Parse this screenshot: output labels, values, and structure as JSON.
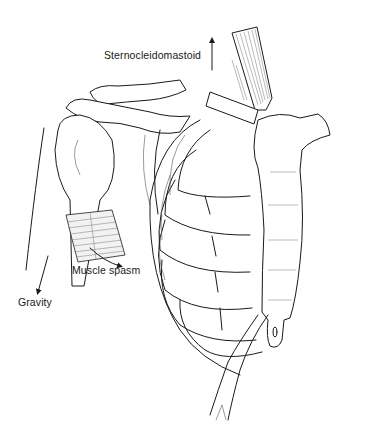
{
  "figure": {
    "colors": {
      "line": "#1a1a1a",
      "background": "#ffffff",
      "muscle_fill": "#f2f2f2"
    }
  },
  "labels": {
    "sternocleidomastoid": "Sternocleidomastoid",
    "muscle_spasm": "Muscle spasm",
    "gravity": "Gravity"
  },
  "arrows": {
    "sternocleidomastoid": "up",
    "muscle_spasm": "curved-down-right",
    "gravity": "down"
  }
}
